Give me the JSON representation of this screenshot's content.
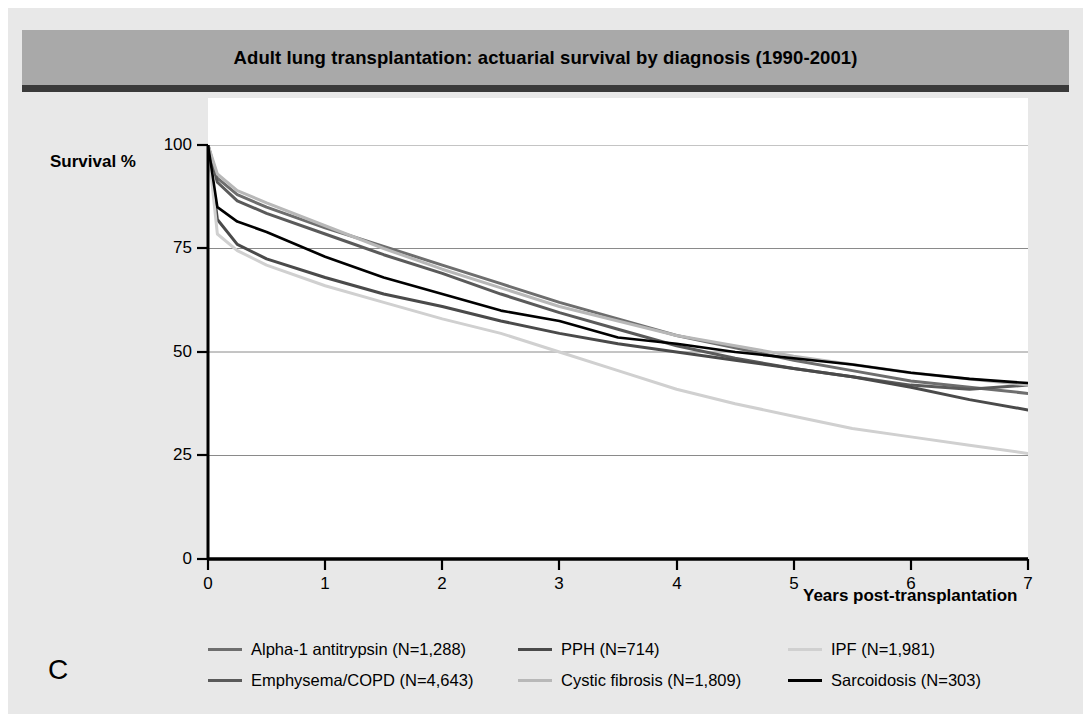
{
  "figure": {
    "panel_letter": "C",
    "title": "Adult lung transplantation: actuarial survival by diagnosis (1990-2001)",
    "title_band_color": "#a9a9a9",
    "background_color": "#e8e8e8",
    "plot_background_color": "#ffffff"
  },
  "axes": {
    "ylabel": "Survival %",
    "xlabel": "Years post-transplantation",
    "yticks": [
      "0",
      "25",
      "50",
      "75",
      "100"
    ],
    "xticks": [
      "0",
      "1",
      "2",
      "3",
      "4",
      "5",
      "6",
      "7"
    ]
  },
  "legend": {
    "row1": [
      {
        "label": "Alpha-1 antitrypsin  (N=1,288)",
        "color": "#6e6e6e"
      },
      {
        "label": "PPH  (N=714)",
        "color": "#4a4a4a"
      },
      {
        "label": "IPF  (N=1,981)",
        "color": "#d0d0d0"
      }
    ],
    "row2": [
      {
        "label": "Emphysema/COPD  (N=4,643)",
        "color": "#5a5a5a"
      },
      {
        "label": "Cystic fibrosis  (N=1,809)",
        "color": "#b8b8b8"
      },
      {
        "label": "Sarcoidosis  (N=303)",
        "color": "#000000"
      }
    ]
  },
  "chart_data": {
    "type": "line",
    "title": "Adult lung transplantation: actuarial survival by diagnosis (1990-2001)",
    "xlabel": "Years post-transplantation",
    "ylabel": "Survival %",
    "xlim": [
      0,
      7
    ],
    "ylim": [
      0,
      100
    ],
    "xticks": [
      0,
      1,
      2,
      3,
      4,
      5,
      6,
      7
    ],
    "yticks": [
      0,
      25,
      50,
      75,
      100
    ],
    "grid": "horizontal",
    "legend_position": "below",
    "series": [
      {
        "name": "Alpha-1 antitrypsin  (N=1,288)",
        "n": 1288,
        "color": "#6e6e6e",
        "width": 3.0,
        "x": [
          0,
          0.08,
          0.25,
          0.5,
          1,
          1.5,
          2,
          2.5,
          3,
          3.5,
          4,
          4.5,
          5,
          5.5,
          6,
          6.5,
          7
        ],
        "y": [
          100,
          92,
          88,
          85,
          80,
          75.5,
          71,
          66.5,
          62,
          58,
          54,
          51,
          48,
          45.5,
          43,
          41.5,
          40
        ]
      },
      {
        "name": "Emphysema/COPD  (N=4,643)",
        "n": 4643,
        "color": "#5a5a5a",
        "width": 3.0,
        "x": [
          0,
          0.08,
          0.25,
          0.5,
          1,
          1.5,
          2,
          2.5,
          3,
          3.5,
          4,
          4.5,
          5,
          5.5,
          6,
          6.5,
          7
        ],
        "y": [
          100,
          91,
          86.5,
          83.5,
          78.5,
          73.5,
          69,
          64,
          59.5,
          55.5,
          51.5,
          48.5,
          46,
          44,
          42,
          41,
          42
        ]
      },
      {
        "name": "PPH  (N=714)",
        "n": 714,
        "color": "#4a4a4a",
        "width": 3.0,
        "x": [
          0,
          0.08,
          0.25,
          0.5,
          1,
          1.5,
          2,
          2.5,
          3,
          3.5,
          4,
          4.5,
          5,
          5.5,
          6,
          6.5,
          7
        ],
        "y": [
          100,
          82,
          76,
          72.5,
          68,
          64,
          61,
          57.5,
          54.5,
          52,
          50,
          48,
          46,
          44,
          41.5,
          38.5,
          36
        ]
      },
      {
        "name": "Cystic fibrosis  (N=1,809)",
        "n": 1809,
        "color": "#b8b8b8",
        "width": 3.0,
        "x": [
          0,
          0.08,
          0.25,
          0.5,
          1,
          1.5,
          2,
          2.5,
          3,
          3.5,
          4,
          4.5,
          5,
          5.5,
          6,
          6.5,
          7
        ],
        "y": [
          100,
          93,
          89,
          86,
          80.5,
          75,
          70,
          65.5,
          61,
          57.5,
          54,
          51.5,
          49,
          47,
          45,
          43.5,
          42
        ]
      },
      {
        "name": "IPF  (N=1,981)",
        "n": 1981,
        "color": "#d0d0d0",
        "width": 3.0,
        "x": [
          0,
          0.08,
          0.25,
          0.5,
          1,
          1.5,
          2,
          2.5,
          3,
          3.5,
          4,
          4.5,
          5,
          5.5,
          6,
          6.5,
          7
        ],
        "y": [
          100,
          78.5,
          74.5,
          71,
          66,
          62,
          58,
          54.5,
          50,
          45.5,
          41,
          37.5,
          34.5,
          31.5,
          29.5,
          27.5,
          25.5
        ]
      },
      {
        "name": "Sarcoidosis  (N=303)",
        "n": 303,
        "color": "#000000",
        "width": 2.6,
        "x": [
          0,
          0.08,
          0.25,
          0.5,
          1,
          1.5,
          2,
          2.5,
          3,
          3.5,
          4,
          4.5,
          5,
          5.5,
          6,
          6.5,
          7
        ],
        "y": [
          100,
          85,
          81.5,
          79,
          73,
          68,
          64,
          60,
          57.5,
          53.5,
          52,
          50,
          48.5,
          47,
          45,
          43.5,
          42.5
        ]
      }
    ]
  }
}
